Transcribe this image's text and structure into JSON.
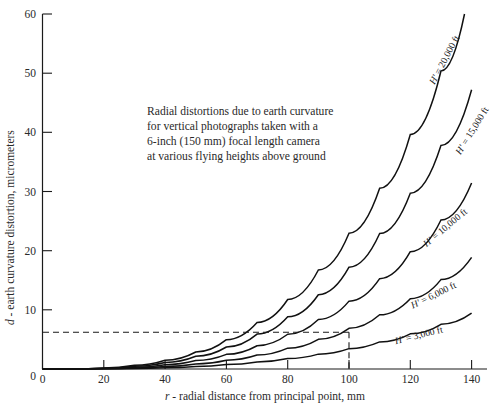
{
  "figure": {
    "background_color": "#ffffff",
    "curve_color": "#111111",
    "text_color": "#2a2a2a",
    "annotation": {
      "line1": "Radial distortions due to earth curvature",
      "line2": "for vertical photographs taken with a",
      "line3": "6-inch (150 mm) focal length camera",
      "line4": "at various flying heights above ground"
    }
  },
  "chart_data": {
    "type": "line",
    "title": "",
    "xlabel": "r - radial distance from principal point, mm",
    "xlabel_italic_part": "r",
    "xlabel_rest": " - radial distance from principal point, mm",
    "ylabel": "d - earth curvature distortion, micrometers",
    "ylabel_italic_part": "d",
    "ylabel_rest": " - earth curvature distortion, micrometers",
    "xlim": [
      0,
      150
    ],
    "ylim": [
      0,
      60
    ],
    "xticks": [
      0,
      20,
      40,
      60,
      80,
      100,
      120,
      140
    ],
    "xtick_labels": [
      "0",
      "20",
      "40",
      "60",
      "80",
      "100",
      "120",
      "140"
    ],
    "yticks": [
      0,
      10,
      20,
      30,
      40,
      50,
      60
    ],
    "ytick_labels": [
      "0",
      "10",
      "20",
      "30",
      "40",
      "50",
      "60"
    ],
    "grid": false,
    "legend_position": "inline-curve-labels",
    "x": [
      0,
      10,
      20,
      30,
      40,
      50,
      60,
      70,
      80,
      90,
      100,
      110,
      120,
      130,
      140,
      150
    ],
    "series": [
      {
        "name": "H' = 20,000 ft",
        "label": "H' = 20,000 ft",
        "flying_height_ft": 20000,
        "label_x": 132,
        "label_y": 52,
        "label_rotation": -62,
        "values": [
          0.0,
          0.02,
          0.18,
          0.62,
          1.47,
          2.87,
          4.96,
          7.87,
          11.75,
          16.73,
          22.94,
          30.53,
          39.63,
          50.37,
          62.9,
          77.3
        ]
      },
      {
        "name": "H' = 15,000 ft",
        "label": "H' = 15,000 ft",
        "flying_height_ft": 15000,
        "label_x": 141,
        "label_y": 40,
        "label_rotation": -58,
        "values": [
          0.0,
          0.015,
          0.135,
          0.465,
          1.1,
          2.15,
          3.72,
          5.9,
          8.81,
          12.55,
          17.2,
          22.9,
          29.72,
          37.78,
          47.2,
          58.0
        ]
      },
      {
        "name": "H' = 10,000 ft",
        "label": "H' = 10,000 ft",
        "flying_height_ft": 10000,
        "label_x": 132,
        "label_y": 23.5,
        "label_rotation": -40,
        "values": [
          0.0,
          0.01,
          0.09,
          0.31,
          0.735,
          1.435,
          2.48,
          3.93,
          5.87,
          8.37,
          11.47,
          15.27,
          19.82,
          25.19,
          31.45,
          38.65
        ]
      },
      {
        "name": "H' = 6,000 ft",
        "label": "H' = 6,000 ft",
        "flying_height_ft": 6000,
        "label_x": 128,
        "label_y": 12.0,
        "label_rotation": -26,
        "values": [
          0.0,
          0.006,
          0.054,
          0.186,
          0.44,
          0.86,
          1.49,
          2.36,
          3.52,
          5.02,
          6.88,
          9.16,
          11.89,
          15.11,
          18.87,
          23.19
        ]
      },
      {
        "name": "H' = 3,000 ft",
        "label": "H' = 3,000 ft",
        "flying_height_ft": 3000,
        "label_x": 123,
        "label_y": 5.2,
        "label_rotation": -14,
        "values": [
          0.0,
          0.003,
          0.027,
          0.093,
          0.22,
          0.43,
          0.745,
          1.18,
          1.76,
          2.51,
          3.44,
          4.58,
          5.95,
          7.56,
          9.43,
          11.6
        ]
      }
    ],
    "annotations": [
      {
        "name": "reference-guide",
        "type": "dashed-crosshair",
        "x_value": 100,
        "y_value": 6.2,
        "curve": "H' = 6,000 ft"
      }
    ],
    "note": "Radial distortions due to earth curvature for vertical photographs taken with a 6-inch (150 mm) focal length camera at various flying heights above ground"
  }
}
